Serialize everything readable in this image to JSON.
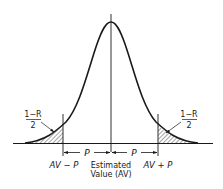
{
  "diagram": {
    "type": "normal-distribution-confidence-interval",
    "colors": {
      "ink": "#1a1a1a",
      "background": "#ffffff"
    },
    "labels": {
      "center": {
        "line1": "Estimated",
        "line2": "Value (AV)"
      },
      "left_bound": "AV − P",
      "right_bound": "AV + P",
      "half_width_left": "P",
      "half_width_right": "P",
      "tail_left": {
        "numerator": "1−R",
        "denominator": "2"
      },
      "tail_right": {
        "numerator": "1−R",
        "denominator": "2"
      }
    }
  }
}
